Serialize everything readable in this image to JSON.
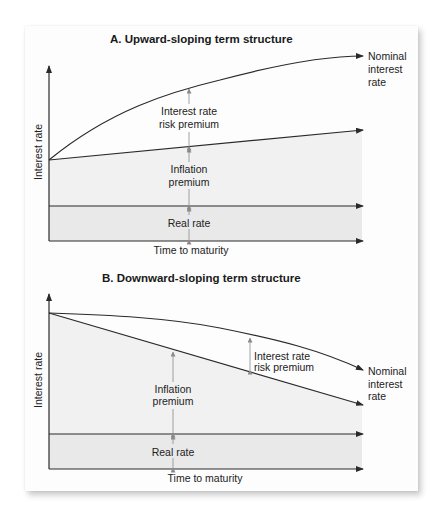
{
  "figure": {
    "panels": [
      {
        "id": "A",
        "title": "A. Upward-sloping term structure",
        "y_axis_label": "Interest rate",
        "x_axis_label": "Time to maturity",
        "curve_label_line1": "Nominal",
        "curve_label_line2": "interest",
        "curve_label_line3": "rate",
        "risk_premium_line1": "Interest rate",
        "risk_premium_line2": "risk premium",
        "inflation_line1": "Inflation",
        "inflation_line2": "premium",
        "real_rate": "Real rate"
      },
      {
        "id": "B",
        "title": "B. Downward-sloping term structure",
        "y_axis_label": "Interest rate",
        "x_axis_label": "Time to maturity",
        "curve_label_line1": "Nominal",
        "curve_label_line2": "interest",
        "curve_label_line3": "rate",
        "risk_premium_line1": "Interest rate",
        "risk_premium_line2": "risk premium",
        "inflation_line1": "Inflation",
        "inflation_line2": "premium",
        "real_rate": "Real rate"
      }
    ],
    "colors": {
      "line": "#2a2a2a",
      "arrow_guide": "#8a8a8a",
      "inflation_fill": "#f1f1f1",
      "real_rate_fill": "#e9e9e9",
      "card_bg": "#fdfdfd"
    }
  }
}
